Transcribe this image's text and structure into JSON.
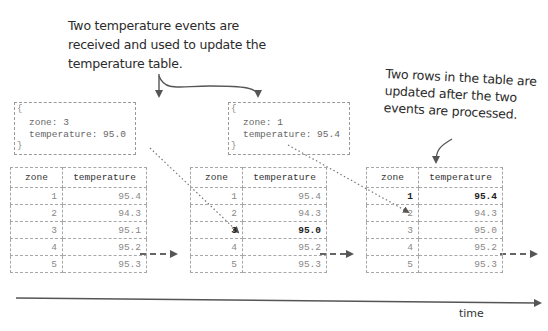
{
  "annotations": {
    "left_note": "Two temperature events are received and used to update the temperature table.",
    "right_note": "Two rows in the table are updated after the two events are processed."
  },
  "events": [
    {
      "open_brace": "{",
      "close_brace": "}",
      "zone_line": "zone: 3",
      "temperature_line": "temperature: 95.0"
    },
    {
      "open_brace": "{",
      "close_brace": "}",
      "zone_line": "zone: 1",
      "temperature_line": "temperature: 95.4"
    }
  ],
  "tables": [
    {
      "headers": [
        "zone",
        "temperature"
      ],
      "rows": [
        {
          "zone": "1",
          "temperature": "95.4"
        },
        {
          "zone": "2",
          "temperature": "94.3"
        },
        {
          "zone": "3",
          "temperature": "95.1"
        },
        {
          "zone": "4",
          "temperature": "95.2"
        },
        {
          "zone": "5",
          "temperature": "95.3"
        }
      ]
    },
    {
      "headers": [
        "zone",
        "temperature"
      ],
      "rows": [
        {
          "zone": "1",
          "temperature": "95.4"
        },
        {
          "zone": "2",
          "temperature": "94.3"
        },
        {
          "zone": "3",
          "temperature": "95.0",
          "updated": true
        },
        {
          "zone": "4",
          "temperature": "95.2"
        },
        {
          "zone": "5",
          "temperature": "95.3"
        }
      ]
    },
    {
      "headers": [
        "zone",
        "temperature"
      ],
      "rows": [
        {
          "zone": "1",
          "temperature": "95.4",
          "updated": true
        },
        {
          "zone": "2",
          "temperature": "94.3"
        },
        {
          "zone": "3",
          "temperature": "95.0"
        },
        {
          "zone": "4",
          "temperature": "95.2"
        },
        {
          "zone": "5",
          "temperature": "95.3"
        }
      ]
    }
  ],
  "timeline": {
    "label": "time"
  },
  "colors": {
    "line": "#555555",
    "dashed_border": "#a8a8a8",
    "text_dim": "#888888",
    "text_strong": "#222222"
  }
}
